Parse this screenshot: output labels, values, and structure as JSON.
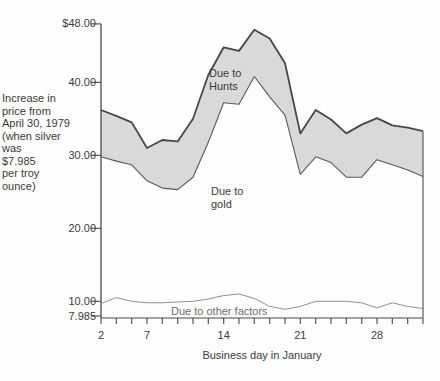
{
  "axis_description": "Increase in\nprice from\nApril 30, 1979\n(when silver\nwas\n$7.985\nper troy\nounce)",
  "annotations": {
    "hunts": "Due to\nHunts",
    "gold": "Due to\ngold",
    "other": "Due to other factors"
  },
  "colors": {
    "hunts_band_fill": "#d9d9d9",
    "top_line": "#474747",
    "middle_line": "#5a5a5a",
    "bottom_line": "#8f8f8f",
    "axis": "#474747",
    "text": "#3b3b3b"
  },
  "chart_data": {
    "type": "area",
    "xlabel": "Business day in January",
    "ylabel": "Increase in price from April 30, 1979 (when silver was $7.985 per troy ounce)",
    "baseline": 7.985,
    "ylim": [
      7.985,
      48
    ],
    "grid": false,
    "x": [
      2,
      3,
      4,
      7,
      8,
      9,
      10,
      11,
      14,
      15,
      16,
      17,
      18,
      21,
      22,
      23,
      24,
      25,
      28,
      29,
      30,
      31
    ],
    "series": [
      {
        "name": "total price (upper boundary, includes Due to Hunts)",
        "values": [
          36.2,
          35.4,
          34.5,
          31.0,
          32.1,
          31.9,
          35.0,
          41.0,
          44.8,
          44.3,
          47.2,
          46.0,
          42.6,
          33.0,
          36.2,
          34.9,
          33.0,
          34.2,
          35.1,
          34.1,
          33.8,
          33.3
        ]
      },
      {
        "name": "due to gold (upper boundary of gold band)",
        "values": [
          29.8,
          29.2,
          28.7,
          26.5,
          25.5,
          25.3,
          27.0,
          31.8,
          37.2,
          37.0,
          40.8,
          38.0,
          35.5,
          27.4,
          29.8,
          29.0,
          27.0,
          27.0,
          29.4,
          28.7,
          28.0,
          27.1
        ]
      },
      {
        "name": "due to other factors (upper boundary)",
        "values": [
          9.7,
          10.5,
          10.0,
          9.8,
          9.8,
          9.9,
          10.0,
          10.3,
          10.8,
          11.0,
          10.4,
          9.3,
          8.9,
          9.3,
          10.0,
          10.0,
          10.0,
          9.8,
          9.1,
          9.8,
          9.3,
          9.0
        ]
      }
    ],
    "yticks": [
      {
        "label": "$48.00",
        "value": 48
      },
      {
        "label": "40.00",
        "value": 40
      },
      {
        "label": "30.00",
        "value": 30
      },
      {
        "label": "20.00",
        "value": 20
      },
      {
        "label": "10.00",
        "value": 10
      },
      {
        "label": "7.985",
        "value": 7.985
      }
    ],
    "xtick_labels": [
      2,
      7,
      14,
      21,
      28
    ]
  }
}
